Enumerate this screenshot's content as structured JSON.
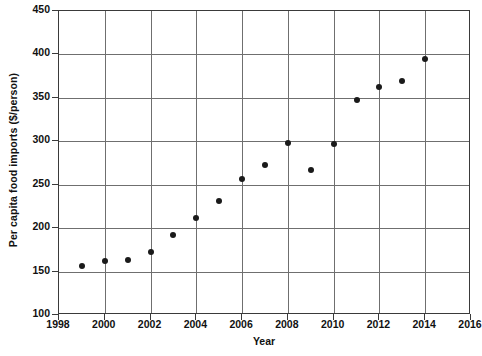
{
  "chart_data": {
    "type": "scatter",
    "title": "",
    "xlabel": "Year",
    "ylabel": "Per capita food imports ($/person)",
    "xlim": [
      1998,
      2016
    ],
    "ylim": [
      100,
      450
    ],
    "xticks": [
      1998,
      2000,
      2002,
      2004,
      2006,
      2008,
      2010,
      2012,
      2014,
      2016
    ],
    "yticks": [
      100,
      150,
      200,
      250,
      300,
      350,
      400,
      450
    ],
    "grid": true,
    "legend": null,
    "marker": "filled-circle",
    "marker_color": "#1a1a1a",
    "x": [
      1999,
      2000,
      2001,
      2002,
      2003,
      2004,
      2005,
      2006,
      2007,
      2008,
      2009,
      2010,
      2011,
      2012,
      2013,
      2014
    ],
    "values": [
      156,
      162,
      163,
      172,
      192,
      212,
      231,
      257,
      273,
      298,
      267,
      297,
      348,
      363,
      369,
      395
    ],
    "points": [
      {
        "x": 1999,
        "y": 156
      },
      {
        "x": 2000,
        "y": 162
      },
      {
        "x": 2001,
        "y": 163
      },
      {
        "x": 2002,
        "y": 172
      },
      {
        "x": 2003,
        "y": 192
      },
      {
        "x": 2004,
        "y": 212
      },
      {
        "x": 2005,
        "y": 231
      },
      {
        "x": 2006,
        "y": 257
      },
      {
        "x": 2007,
        "y": 273
      },
      {
        "x": 2008,
        "y": 298
      },
      {
        "x": 2009,
        "y": 267
      },
      {
        "x": 2010,
        "y": 297
      },
      {
        "x": 2011,
        "y": 348
      },
      {
        "x": 2012,
        "y": 363
      },
      {
        "x": 2013,
        "y": 369
      },
      {
        "x": 2014,
        "y": 395
      }
    ]
  }
}
